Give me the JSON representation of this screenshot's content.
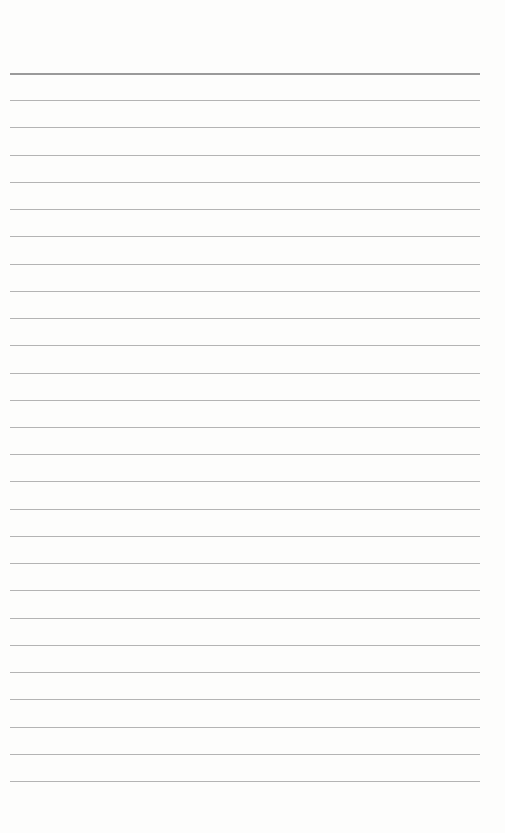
{
  "page": {
    "type": "lined-paper",
    "background": "#fdfdfc",
    "rule_color": "#b4b4b4",
    "top_rule_color": "#9a9a9a",
    "rule_count": 27,
    "first_rule_y": 73,
    "rule_spacing": 27.23,
    "rule_left": 10,
    "rule_width": 470
  }
}
